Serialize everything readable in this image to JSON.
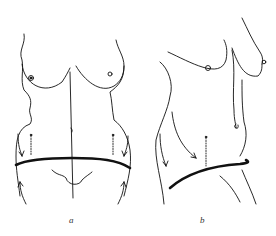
{
  "figure": {
    "panels": [
      {
        "id": "a",
        "label": "a",
        "view": "frontal torso with horizontal incision line and upward/downward arrows"
      },
      {
        "id": "b",
        "label": "b",
        "view": "oblique torso with curved incision line and downward arrows"
      }
    ],
    "colors": {
      "line": "#111111",
      "background": "#ffffff"
    }
  }
}
